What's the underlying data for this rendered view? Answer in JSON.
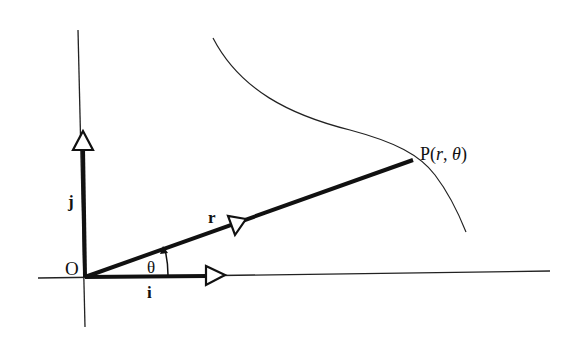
{
  "diagram": {
    "colors": {
      "ink": "#111111",
      "background": "#ffffff"
    },
    "labels": {
      "origin": "O",
      "unit_i": "i",
      "unit_j": "j",
      "position_vector": "r",
      "angle": "θ",
      "point_prefix": "P(",
      "point_r": "r",
      "point_sep": ", ",
      "point_theta": "θ",
      "point_suffix": ")"
    },
    "elements": {
      "x_axis": {
        "from": [
          38,
          278
        ],
        "to": [
          550,
          271
        ]
      },
      "y_axis": {
        "from": [
          78,
          30
        ],
        "to": [
          85,
          327
        ]
      },
      "origin": [
        85,
        277
      ],
      "vector_i": {
        "from": [
          85,
          277
        ],
        "to": [
          225,
          275
        ]
      },
      "vector_j": {
        "from": [
          85,
          277
        ],
        "to": [
          83,
          130
        ]
      },
      "vector_r": {
        "from": [
          85,
          277
        ],
        "to": [
          413,
          160
        ]
      },
      "point_P": [
        413,
        160
      ],
      "curve": {
        "start": [
          213,
          38
        ],
        "end": [
          466,
          232
        ]
      }
    }
  }
}
